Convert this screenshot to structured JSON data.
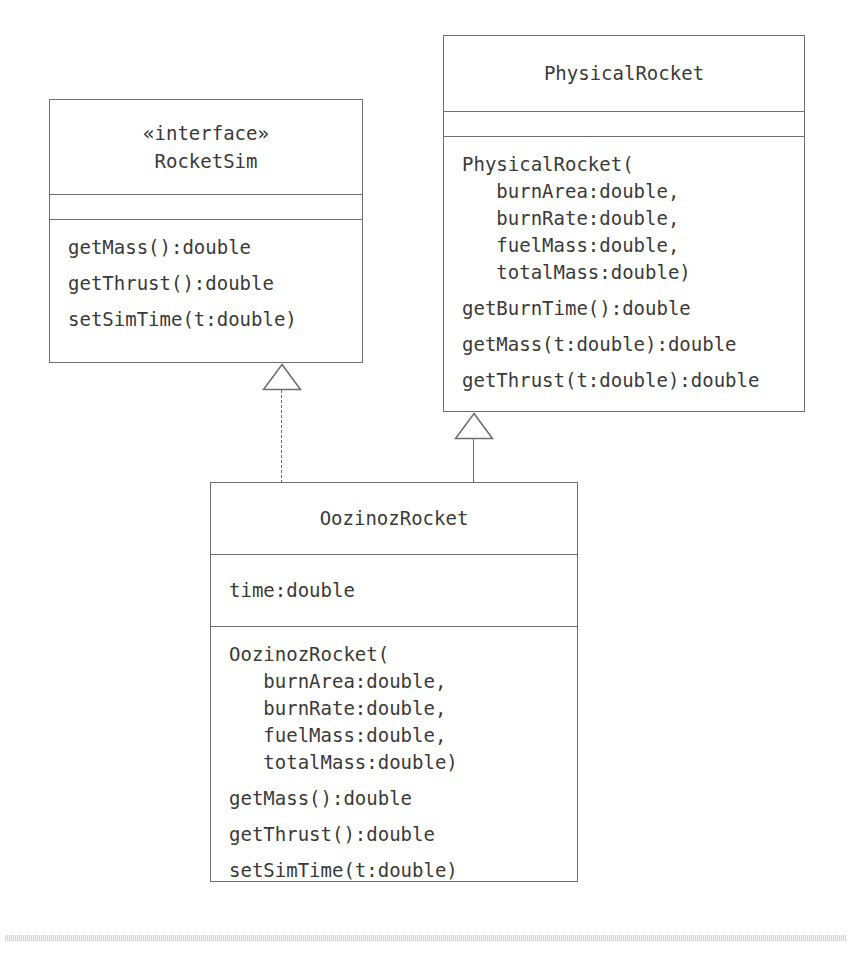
{
  "diagram": {
    "type": "uml-class-diagram",
    "classes": [
      {
        "id": "rocketsim",
        "stereotype": "«interface»",
        "name": "RocketSim",
        "attributes": [],
        "methods": [
          "getMass():double",
          "getThrust():double",
          "setSimTime(t:double)"
        ]
      },
      {
        "id": "physicalrocket",
        "stereotype": "",
        "name": "PhysicalRocket",
        "attributes": [],
        "methods": [
          "PhysicalRocket(\n   burnArea:double,\n   burnRate:double,\n   fuelMass:double,\n   totalMass:double)",
          "getBurnTime():double",
          "getMass(t:double):double",
          "getThrust(t:double):double"
        ]
      },
      {
        "id": "oozinozrocket",
        "stereotype": "",
        "name": "OozinozRocket",
        "attributes": [
          "time:double"
        ],
        "methods": [
          "OozinozRocket(\n   burnArea:double,\n   burnRate:double,\n   fuelMass:double,\n   totalMass:double)",
          "getMass():double",
          "getThrust():double",
          "setSimTime(t:double)"
        ]
      }
    ],
    "relationships": [
      {
        "id": "realization",
        "kind": "realization",
        "line_style": "dashed",
        "arrow": "hollow-triangle",
        "from": "OozinozRocket",
        "to": "RocketSim"
      },
      {
        "id": "generalization",
        "kind": "generalization",
        "line_style": "solid",
        "arrow": "hollow-triangle",
        "from": "OozinozRocket",
        "to": "PhysicalRocket"
      }
    ],
    "colors": {
      "background": "#ffffff",
      "stroke": "#6e6e6e",
      "text": "#3a3a3a",
      "footer_rule": "#d4d4d4"
    }
  }
}
